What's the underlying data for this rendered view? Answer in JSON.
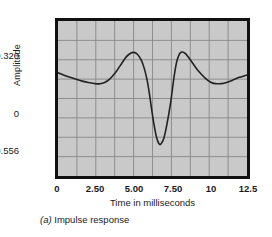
{
  "figure": {
    "caption_prefix": "(a)",
    "caption_text": "Impulse response"
  },
  "chart_data": {
    "type": "line",
    "title": "",
    "xlabel": "Time in milliseconds",
    "ylabel": "Amplitude",
    "xlim": [
      0,
      12.5
    ],
    "ylim": [
      -0.86,
      0.62
    ],
    "grid": true,
    "legend": "none",
    "x_ticks": [
      0,
      2.5,
      5,
      7.5,
      10,
      12.5
    ],
    "x_tick_labels": [
      "0",
      "2.50",
      "5.00",
      "7.50",
      "10",
      "12.5"
    ],
    "y_ticks": [
      0.32,
      0,
      -0.556
    ],
    "y_tick_labels": [
      "0.320",
      "0",
      "−0.556"
    ],
    "grid_columns": 10,
    "grid_rows": 8,
    "series": [
      {
        "name": "impulse response",
        "color": "#222222",
        "x": [
          0.0,
          0.4,
          0.8,
          1.2,
          1.6,
          2.0,
          2.4,
          2.7,
          3.0,
          3.3,
          3.6,
          3.9,
          4.2,
          4.5,
          4.75,
          5.0,
          5.25,
          5.5,
          5.7,
          5.9,
          6.05,
          6.2,
          6.35,
          6.5,
          6.65,
          6.8,
          7.0,
          7.2,
          7.45,
          7.65,
          7.85,
          8.1,
          8.4,
          8.7,
          9.0,
          9.3,
          9.7,
          10.1,
          10.4,
          10.8,
          11.2,
          11.6,
          12.0,
          12.5
        ],
        "y": [
          0.125,
          0.103,
          0.082,
          0.063,
          0.046,
          0.032,
          0.023,
          0.02,
          0.028,
          0.052,
          0.093,
          0.148,
          0.212,
          0.275,
          0.307,
          0.32,
          0.303,
          0.248,
          0.17,
          0.05,
          -0.08,
          -0.23,
          -0.37,
          -0.48,
          -0.545,
          -0.556,
          -0.5,
          -0.37,
          -0.16,
          0.06,
          0.23,
          0.318,
          0.312,
          0.26,
          0.198,
          0.14,
          0.08,
          0.035,
          0.022,
          0.022,
          0.036,
          0.058,
          0.082,
          0.105
        ]
      }
    ]
  }
}
